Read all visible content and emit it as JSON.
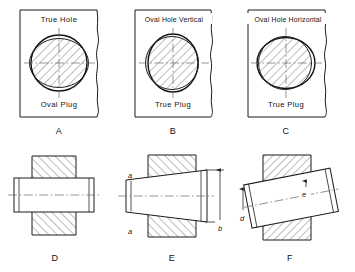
{
  "figure": {
    "panels": [
      {
        "key": "A",
        "letter": "A",
        "top_label": "True Hole",
        "bottom_label": "Oval Plug",
        "hole_shape": "circle",
        "plug_shape": "oval-horizontal",
        "description": "True round hole with an oval (horizontally elongated) plug"
      },
      {
        "key": "B",
        "letter": "B",
        "top_label": "Oval Hole Vertical",
        "bottom_label": "True Plug",
        "hole_shape": "oval-vertical",
        "plug_shape": "circle",
        "description": "Vertically oval hole with a true round plug"
      },
      {
        "key": "C",
        "letter": "C",
        "top_label": "Oval Hole Horizontal",
        "bottom_label": "True Plug",
        "hole_shape": "oval-horizontal",
        "plug_shape": "circle",
        "description": "Horizontally oval hole with a true round plug"
      },
      {
        "key": "D",
        "letter": "D",
        "top_label": "",
        "bottom_label": "",
        "description": "Section view: straight cylindrical plug seated in tapered hole"
      },
      {
        "key": "E",
        "letter": "E",
        "top_label": "",
        "bottom_label": "",
        "description": "Section view: tapered plug in straight hole, clearance a at both ends, overall b"
      },
      {
        "key": "F",
        "letter": "F",
        "top_label": "",
        "bottom_label": "",
        "description": "Section view: plug tilted in hole, offsets d and e"
      }
    ],
    "dimensions": [
      {
        "key": "a_top",
        "label": "a",
        "panel": "E"
      },
      {
        "key": "a_bottom",
        "label": "a",
        "panel": "E"
      },
      {
        "key": "b",
        "label": "b",
        "panel": "E"
      },
      {
        "key": "d",
        "label": "d",
        "panel": "F"
      },
      {
        "key": "e",
        "label": "e",
        "panel": "F"
      }
    ],
    "colors": {
      "background": "#ffffff",
      "line": "#1c1c1c",
      "centerline": "#6b6b6b",
      "hatch": "#333333",
      "text": "#121212"
    }
  }
}
